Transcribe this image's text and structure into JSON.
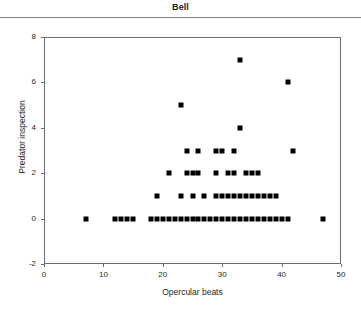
{
  "chart_data": {
    "type": "scatter",
    "title": "Bell",
    "xlabel": "Opercular beats",
    "ylabel": "Predator inspection",
    "xlim": [
      0,
      50
    ],
    "ylim": [
      -2,
      8
    ],
    "xticks": [
      "0",
      "10",
      "20",
      "30",
      "40",
      "50"
    ],
    "xtick_values": [
      0,
      10,
      20,
      30,
      40,
      50
    ],
    "yticks": [
      "-2",
      "0",
      "2",
      "4",
      "6",
      "8"
    ],
    "ytick_values": [
      -2,
      0,
      2,
      4,
      6,
      8
    ],
    "grid": false,
    "legend": null,
    "marker": "filled-square",
    "marker_color": "#000000",
    "points": [
      [
        7,
        0
      ],
      [
        12,
        0
      ],
      [
        13,
        0
      ],
      [
        14,
        0
      ],
      [
        15,
        0
      ],
      [
        18,
        0
      ],
      [
        19,
        0
      ],
      [
        20,
        0
      ],
      [
        21,
        0
      ],
      [
        22,
        0
      ],
      [
        23,
        0
      ],
      [
        24,
        0
      ],
      [
        25,
        0
      ],
      [
        26,
        0
      ],
      [
        27,
        0
      ],
      [
        28,
        0
      ],
      [
        29,
        0
      ],
      [
        30,
        0
      ],
      [
        31,
        0
      ],
      [
        32,
        0
      ],
      [
        33,
        0
      ],
      [
        34,
        0
      ],
      [
        35,
        0
      ],
      [
        36,
        0
      ],
      [
        37,
        0
      ],
      [
        38,
        0
      ],
      [
        39,
        0
      ],
      [
        40,
        0
      ],
      [
        41,
        0
      ],
      [
        47,
        0
      ],
      [
        19,
        1
      ],
      [
        23,
        1
      ],
      [
        25,
        1
      ],
      [
        27,
        1
      ],
      [
        29,
        1
      ],
      [
        30,
        1
      ],
      [
        31,
        1
      ],
      [
        32,
        1
      ],
      [
        33,
        1
      ],
      [
        34,
        1
      ],
      [
        35,
        1
      ],
      [
        36,
        1
      ],
      [
        37,
        1
      ],
      [
        38,
        1
      ],
      [
        39,
        1
      ],
      [
        21,
        2
      ],
      [
        24,
        2
      ],
      [
        25,
        2
      ],
      [
        26,
        2
      ],
      [
        29,
        2
      ],
      [
        31,
        2
      ],
      [
        32,
        2
      ],
      [
        34,
        2
      ],
      [
        35,
        2
      ],
      [
        36,
        2
      ],
      [
        24,
        3
      ],
      [
        26,
        3
      ],
      [
        29,
        3
      ],
      [
        30,
        3
      ],
      [
        32,
        3
      ],
      [
        42,
        3
      ],
      [
        33,
        4
      ],
      [
        23,
        5
      ],
      [
        41,
        6
      ],
      [
        33,
        7
      ]
    ]
  },
  "axes": {
    "frame_color": "#6d6e71"
  }
}
